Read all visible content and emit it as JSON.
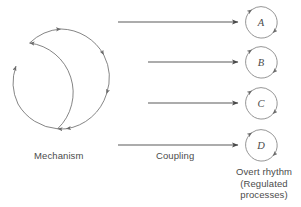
{
  "figure": {
    "type": "conceptual-diagram",
    "background_color": "#ffffff",
    "stroke_color": "#555555",
    "text_color": "#4b4b4b"
  },
  "mechanism": {
    "label": "Mechanism",
    "shape": "large-circular-arrow-loop",
    "direction": "clockwise",
    "center_x": 62,
    "center_y": 79,
    "radius": 50,
    "arrowhead_count": 6
  },
  "coupling": {
    "label": "Coupling",
    "arrow_count": 4,
    "arrows": [
      {
        "name": "coupling-arrow-a",
        "x1": 118,
        "x2": 240,
        "y": 22
      },
      {
        "name": "coupling-arrow-b",
        "x1": 148,
        "x2": 240,
        "y": 62
      },
      {
        "name": "coupling-arrow-c",
        "x1": 148,
        "x2": 240,
        "y": 103
      },
      {
        "name": "coupling-arrow-d",
        "x1": 118,
        "x2": 240,
        "y": 145
      }
    ]
  },
  "overt_rhythm": {
    "caption_lines": [
      "Overt rhythm",
      "(Regulated",
      "processes)"
    ],
    "circles": [
      {
        "label": "A",
        "cx": 261,
        "cy": 22,
        "r": 15
      },
      {
        "label": "B",
        "cx": 261,
        "cy": 62,
        "r": 15
      },
      {
        "label": "C",
        "cx": 261,
        "cy": 103,
        "r": 15
      },
      {
        "label": "D",
        "cx": 261,
        "cy": 145,
        "r": 15
      }
    ]
  }
}
